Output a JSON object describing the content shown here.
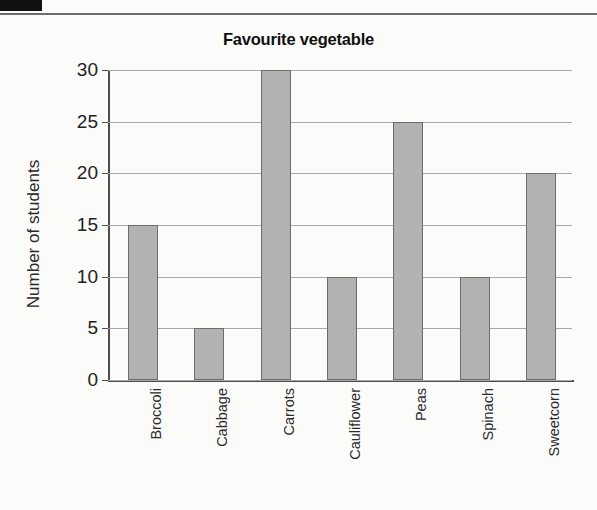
{
  "page": {
    "marker_label": "",
    "background_color": "#fbfbfa"
  },
  "chart_data": {
    "type": "bar",
    "title": "Favourite vegetable",
    "xlabel": "",
    "ylabel": "Number of students",
    "categories": [
      "Broccoli",
      "Cabbage",
      "Carrots",
      "Cauliflower",
      "Peas",
      "Spinach",
      "Sweetcorn"
    ],
    "values": [
      15,
      5,
      30,
      10,
      25,
      10,
      20
    ],
    "ylim": [
      0,
      30
    ],
    "ytick_labels": [
      "0",
      "5",
      "10",
      "15",
      "20",
      "25",
      "30"
    ],
    "ytick_values": [
      0,
      5,
      10,
      15,
      20,
      25,
      30
    ],
    "grid": true,
    "legend": false,
    "bar_fill_color": "#b2b2b2",
    "bar_edge_color": "#6c6c6c",
    "axis_color": "#4d4d4d",
    "grid_color": "#a9a9a9"
  }
}
